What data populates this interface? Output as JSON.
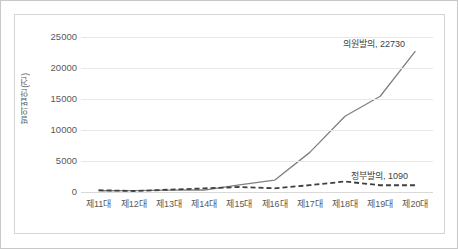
{
  "chart_data": {
    "type": "line",
    "title": "",
    "subtitle": "",
    "xlabel": "",
    "ylabel": "발의법안(건)",
    "ylim": [
      0,
      25000
    ],
    "grid": true,
    "legend_position": "none",
    "categories": [
      "제11대",
      "제12대",
      "제13대",
      "제14대",
      "제15대",
      "제16대",
      "제17대",
      "제18대",
      "제19대",
      "제20대"
    ],
    "yticks": [
      0,
      5000,
      10000,
      15000,
      20000,
      25000
    ],
    "ytick_labels": [
      "0",
      "5000",
      "10000",
      "15000",
      "20000",
      "25000"
    ],
    "series": [
      {
        "name": "의원발의",
        "style": "solid",
        "color": "#808080",
        "values": [
          200,
          230,
          300,
          320,
          1140,
          1910,
          6390,
          12220,
          15440,
          22730
        ],
        "end_label": "의원발의, 22730"
      },
      {
        "name": "정부발의",
        "style": "dashed",
        "color": "#404040",
        "values": [
          290,
          160,
          370,
          580,
          810,
          600,
          1100,
          1690,
          1090,
          1090
        ],
        "end_label": "정부발의, 1090"
      }
    ],
    "annotations": [
      {
        "id": "uiwon",
        "text": "의원발의, 22730"
      },
      {
        "id": "jeongbu",
        "text": "정부발의, 1090"
      }
    ]
  }
}
